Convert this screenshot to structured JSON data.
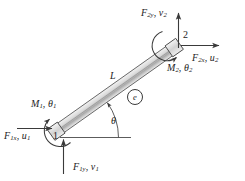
{
  "figure": {
    "element_label": "e",
    "length_label": "L",
    "angle_label": "θ",
    "colors": {
      "line": "#3a3a3a",
      "beam_fill_light": "#e8e8e8",
      "beam_fill_dark": "#9a9a9a",
      "text": "#1c1c1c",
      "background": "#ffffff"
    }
  },
  "node1": {
    "number": "1",
    "force_x": {
      "force": "F",
      "force_sub": "1x",
      "disp": "u",
      "disp_sub": "1",
      "separator": ", "
    },
    "force_y": {
      "force": "F",
      "force_sub": "1y",
      "disp": "v",
      "disp_sub": "1",
      "separator": ", "
    },
    "moment": {
      "moment": "M",
      "moment_sub": "1",
      "rot": "θ",
      "rot_sub": "1",
      "separator": ", "
    }
  },
  "node2": {
    "number": "2",
    "force_x": {
      "force": "F",
      "force_sub": "2x",
      "disp": "u",
      "disp_sub": "2",
      "separator": ", "
    },
    "force_y": {
      "force": "F",
      "force_sub": "2y",
      "disp": "v",
      "disp_sub": "2",
      "separator": ", "
    },
    "moment": {
      "moment": "M",
      "moment_sub": "2",
      "rot": "θ",
      "rot_sub": "2",
      "separator": ", "
    }
  }
}
